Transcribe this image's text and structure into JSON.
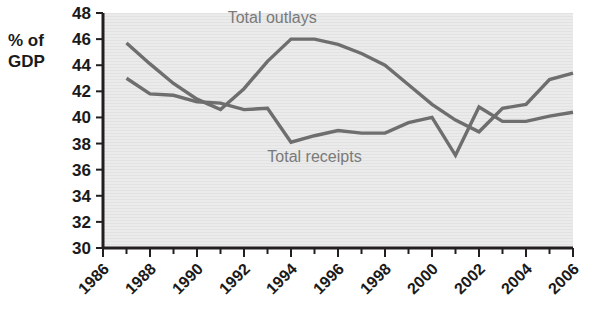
{
  "chart_data": {
    "type": "line",
    "title": "",
    "xlabel": "",
    "ylabel": "% of GDP",
    "ylabel_lines": [
      "% of",
      "GDP"
    ],
    "xlim": [
      1986,
      2006
    ],
    "ylim": [
      30,
      48
    ],
    "ytick_labels": [
      "48",
      "46",
      "44",
      "42",
      "40",
      "38",
      "36",
      "34",
      "32",
      "30"
    ],
    "ytick_values": [
      48,
      46,
      44,
      42,
      40,
      38,
      36,
      34,
      32,
      30
    ],
    "xtick_labels": [
      "1986",
      "1988",
      "1990",
      "1992",
      "1994",
      "1996",
      "1998",
      "2000",
      "2002",
      "2004",
      "2006"
    ],
    "xtick_values": [
      1986,
      1988,
      1990,
      1992,
      1994,
      1996,
      1998,
      2000,
      2002,
      2004,
      2006
    ],
    "minor_xtick_values": [
      1987,
      1989,
      1991,
      1993,
      1995,
      1997,
      1999,
      2001,
      2003,
      2005
    ],
    "grid": false,
    "legend_position": "inline-annotation",
    "plot_background": "#ebebeb",
    "line_color": "#6e6e6e",
    "axis_color": "#231f20",
    "series": [
      {
        "name": "Total outlays",
        "label_x": 1993.2,
        "label_y": 47.2,
        "x": [
          1987,
          1988,
          1989,
          1990,
          1991,
          1992,
          1993,
          1994,
          1995,
          1996,
          1997,
          1998,
          1999,
          2000,
          2001,
          2002,
          2003,
          2004,
          2005,
          2006
        ],
        "values": [
          45.7,
          44.1,
          42.6,
          41.4,
          40.6,
          42.2,
          44.3,
          46.0,
          46.0,
          45.6,
          44.9,
          44.0,
          42.5,
          41.0,
          39.8,
          38.9,
          40.7,
          41.0,
          42.9,
          43.4
        ]
      },
      {
        "name": "Total receipts",
        "label_x": 1995.0,
        "label_y": 36.6,
        "x": [
          1987,
          1988,
          1989,
          1990,
          1991,
          1992,
          1993,
          1994,
          1995,
          1996,
          1997,
          1998,
          1999,
          2000,
          2001,
          2002,
          2003,
          2004,
          2005,
          2006
        ],
        "values": [
          43.0,
          41.8,
          41.7,
          41.2,
          41.1,
          40.6,
          40.7,
          38.1,
          38.6,
          39.0,
          38.8,
          38.8,
          39.6,
          40.0,
          37.1,
          40.8,
          39.7,
          39.7,
          40.1,
          40.4
        ]
      }
    ]
  }
}
